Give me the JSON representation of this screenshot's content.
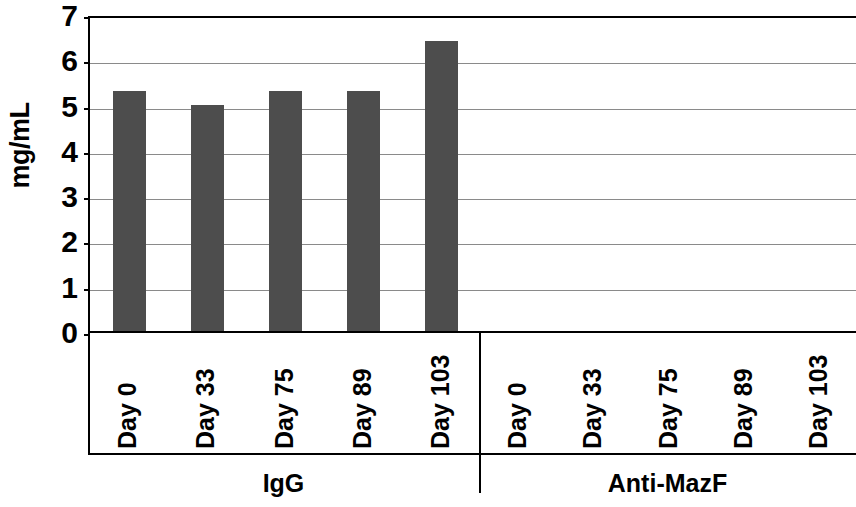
{
  "chart_data": {
    "type": "bar",
    "title": "",
    "xlabel": "",
    "ylabel": "mg/mL",
    "ylim": [
      0,
      7
    ],
    "ytick_values": [
      7,
      6,
      5,
      4,
      3,
      2,
      1,
      0
    ],
    "ytick_labels": [
      "7",
      "6",
      "5",
      "4",
      "3",
      "2",
      "1",
      "0"
    ],
    "grid": true,
    "legend": "none",
    "bar_color": "#4d4d4d",
    "axis_color": "#000000",
    "gridline_color": "#8a8a8a",
    "categories": [
      "Day 0",
      "Day 33",
      "Day 75",
      "Day 89",
      "Day 103"
    ],
    "groups": [
      {
        "name": "IgG",
        "categories": [
          "Day 0",
          "Day 33",
          "Day 75",
          "Day 89",
          "Day 103"
        ],
        "values": [
          5.3,
          5.0,
          5.3,
          5.3,
          6.4
        ]
      },
      {
        "name": "Anti-MazF",
        "categories": [
          "Day 0",
          "Day 33",
          "Day 75",
          "Day 89",
          "Day 103"
        ],
        "values": [
          0,
          0,
          0,
          0,
          0
        ]
      }
    ],
    "series": [
      {
        "name": "IgG",
        "values": [
          5.3,
          5.0,
          5.3,
          5.3,
          6.4
        ]
      },
      {
        "name": "Anti-MazF",
        "values": [
          0,
          0,
          0,
          0,
          0
        ]
      }
    ]
  },
  "axis": {
    "y_title": "mg/mL",
    "ticks": [
      {
        "label": "7"
      },
      {
        "label": "6"
      },
      {
        "label": "5"
      },
      {
        "label": "4"
      },
      {
        "label": "3"
      },
      {
        "label": "2"
      },
      {
        "label": "1"
      },
      {
        "label": "0"
      }
    ]
  },
  "groups": [
    {
      "label": "IgG"
    },
    {
      "label": "Anti-MazF"
    }
  ],
  "categories": [
    {
      "label": "Day 0"
    },
    {
      "label": "Day 33"
    },
    {
      "label": "Day 75"
    },
    {
      "label": "Day 89"
    },
    {
      "label": "Day 103"
    }
  ]
}
